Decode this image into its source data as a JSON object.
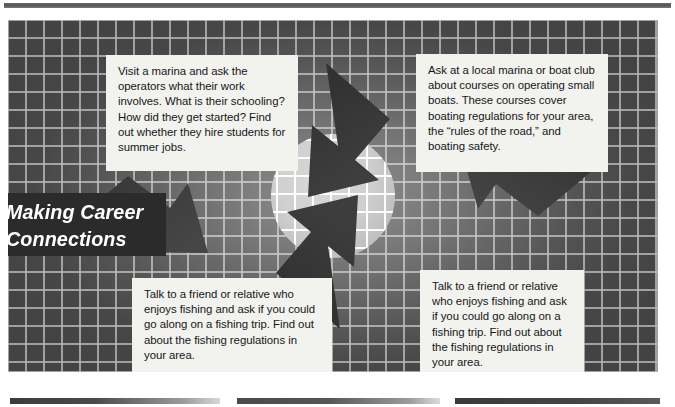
{
  "document": {
    "title": "Making Career Connections",
    "type": "textbook-feature-graphic"
  },
  "banner": {
    "name": "making-career-connections-banner",
    "line1": "Making Career",
    "line2": "Connections",
    "background_color": "#2b2b2b",
    "text_color": "#ffffff"
  },
  "callouts": [
    {
      "id": "callout-top-left",
      "position": "top-left",
      "text": "Visit a marina and ask the operators what their work involves. What is their schooling? How did they get started? Find out whether they hire students for summer jobs."
    },
    {
      "id": "callout-top-right",
      "position": "top-right",
      "text": "Ask at a local marina or boat club about courses on operating small boats. These courses cover boating regulations for your area, the “rules of the road,” and boating safety."
    },
    {
      "id": "callout-bottom-left",
      "position": "bottom-left",
      "text": "Talk to a friend or relative who enjoys fishing and ask if you could go along on a fishing trip. Find out about the fishing regulations in your area."
    },
    {
      "id": "callout-bottom-right",
      "position": "bottom-right",
      "text": "Talk to a friend or relative who enjoys fishing and ask if you could go along on a fishing trip. Find out about the fishing regulations in your area."
    }
  ],
  "graphic": {
    "center_shape": "circle",
    "arrow_count": 4,
    "arrangement": "pinwheel-inward",
    "background": "gridded-gray-gradient",
    "colors": {
      "arrow": "#3a3a3a",
      "circle": "#cfcfcf",
      "grid_line": "#ffffff",
      "panel_dark": "#474747",
      "panel_light": "#8e8e8e"
    }
  },
  "rules": {
    "top_rule_color": "#5a5a5a",
    "bottom_bar_count": 3
  }
}
